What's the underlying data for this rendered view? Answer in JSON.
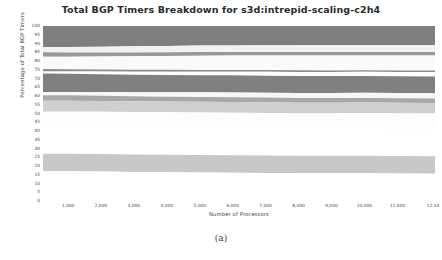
{
  "figure": {
    "title": "Total BGP Timers Breakdown for s3d:intrepid-scaling-c2h4",
    "caption": "(a)"
  },
  "axes": {
    "ylabel": "Percentage of Total BGP Timers",
    "xlabel": "Number of Processors",
    "yticks": [
      "100",
      "95",
      "90",
      "85",
      "80",
      "75",
      "70",
      "65",
      "60",
      "55",
      "50",
      "45",
      "40",
      "35",
      "30",
      "25",
      "20",
      "15",
      "10",
      "5",
      "0"
    ],
    "xticks": [
      "1,000",
      "2,000",
      "3,000",
      "4,000",
      "5,000",
      "6,000",
      "7,000",
      "8,000",
      "9,000",
      "10,000",
      "11,000",
      "12,14"
    ]
  },
  "chart_data": {
    "type": "area",
    "title": "Total BGP Timers Breakdown for s3d:intrepid-scaling-c2h4",
    "xlabel": "Number of Processors",
    "ylabel": "Percentage of Total BGP Timers",
    "xlim": [
      240,
      12144
    ],
    "ylim": [
      0,
      100
    ],
    "grid": false,
    "legend": "none",
    "stacked": true,
    "x": [
      240,
      1000,
      2000,
      3000,
      4000,
      5000,
      6000,
      7000,
      8000,
      9000,
      10000,
      11000,
      12144
    ],
    "series": [
      {
        "name": "band-1",
        "color": "#7f7f7f",
        "values": [
          12.0,
          12.0,
          11.8,
          11.6,
          11.4,
          11.2,
          11.1,
          11.0,
          11.0,
          10.9,
          10.9,
          10.8,
          10.8
        ]
      },
      {
        "name": "band-2",
        "color": "#f2f2f2",
        "values": [
          3.0,
          3.1,
          3.3,
          3.5,
          3.6,
          3.7,
          3.8,
          3.9,
          3.9,
          4.0,
          4.0,
          4.1,
          4.1
        ]
      },
      {
        "name": "band-3",
        "color": "#989898",
        "values": [
          2.6,
          2.5,
          2.3,
          2.2,
          2.1,
          2.1,
          2.0,
          2.0,
          2.0,
          2.0,
          1.9,
          1.9,
          1.9
        ]
      },
      {
        "name": "band-4",
        "color": "#fafafa",
        "values": [
          7.0,
          7.1,
          7.4,
          7.7,
          7.9,
          8.1,
          8.2,
          8.3,
          8.4,
          8.5,
          8.5,
          8.6,
          8.6
        ]
      },
      {
        "name": "band-5",
        "color": "#8c8c8c",
        "values": [
          1.4,
          1.3,
          1.2,
          1.1,
          1.1,
          1.0,
          1.0,
          1.0,
          1.0,
          0.9,
          0.9,
          0.9,
          0.9
        ]
      },
      {
        "name": "band-6",
        "color": "#ffffff",
        "values": [
          1.2,
          1.3,
          1.5,
          1.7,
          1.9,
          2.0,
          2.1,
          2.2,
          2.3,
          2.3,
          2.4,
          2.4,
          2.5
        ]
      },
      {
        "name": "band-7",
        "color": "#808080",
        "values": [
          10.5,
          10.4,
          10.2,
          10.0,
          9.9,
          9.8,
          9.8,
          9.7,
          9.7,
          9.7,
          9.6,
          9.6,
          9.6
        ]
      },
      {
        "name": "band-8",
        "color": "#f7f7f7",
        "values": [
          1.8,
          1.9,
          2.1,
          2.3,
          2.5,
          2.6,
          2.7,
          2.8,
          2.8,
          2.9,
          2.9,
          3.0,
          3.0
        ]
      },
      {
        "name": "band-9",
        "color": "#a8a8a8",
        "values": [
          3.2,
          3.1,
          3.0,
          2.9,
          2.8,
          2.8,
          2.7,
          2.7,
          2.7,
          2.6,
          2.6,
          2.6,
          2.6
        ]
      },
      {
        "name": "band-10",
        "color": "#cfcfcf",
        "values": [
          6.3,
          6.3,
          6.2,
          6.2,
          6.1,
          6.1,
          6.1,
          6.1,
          6.0,
          6.0,
          6.0,
          6.0,
          6.0
        ]
      },
      {
        "name": "band-11",
        "color": "#fdfdfd",
        "values": [
          9.0,
          9.0,
          9.1,
          9.2,
          9.2,
          9.3,
          9.3,
          9.3,
          9.4,
          9.4,
          9.4,
          9.4,
          9.4
        ]
      },
      {
        "name": "band-12",
        "color": "#ffffff",
        "values": [
          15.0,
          15.0,
          15.0,
          15.0,
          15.0,
          15.0,
          15.0,
          15.0,
          15.0,
          15.0,
          15.0,
          15.0,
          15.0
        ]
      },
      {
        "name": "band-13",
        "color": "#c8c8c8",
        "values": [
          10.0,
          10.0,
          10.0,
          10.0,
          10.0,
          10.0,
          10.0,
          10.0,
          10.0,
          10.0,
          10.0,
          10.0,
          10.0
        ]
      },
      {
        "name": "band-14",
        "color": "#ffffff",
        "values": [
          17.0,
          17.0,
          17.0,
          17.0,
          17.0,
          17.0,
          17.0,
          17.0,
          17.0,
          17.0,
          17.0,
          17.0,
          17.0
        ]
      }
    ]
  }
}
